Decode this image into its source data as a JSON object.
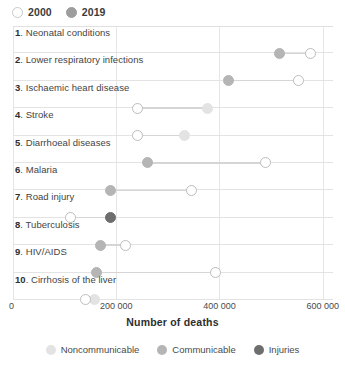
{
  "series_legend": {
    "items": [
      {
        "label": "2000",
        "style": "open",
        "icon": "circle-outline-icon"
      },
      {
        "label": "2019",
        "style": "filled",
        "icon": "circle-filled-icon"
      }
    ]
  },
  "category_legend": {
    "items": [
      {
        "label": "Noncommunicable",
        "color": "#e3e3e3",
        "icon": "circle-filled-icon"
      },
      {
        "label": "Communicable",
        "color": "#b5b5b5",
        "icon": "circle-filled-icon"
      },
      {
        "label": "Injuries",
        "color": "#6e6e6e",
        "icon": "circle-filled-icon"
      }
    ]
  },
  "chart_data": {
    "type": "scatter",
    "subtype": "dumbbell",
    "title": "",
    "xlabel": "Number of deaths",
    "ylabel": "",
    "xlim": [
      0,
      620000
    ],
    "xticks": [
      0,
      200000,
      400000,
      600000
    ],
    "xtick_labels": [
      "0",
      "200 000",
      "400 000",
      "600 000"
    ],
    "grid": "vertical",
    "legend_position": "top-left and bottom-center",
    "series": [
      {
        "name": "2000",
        "marker": "open-circle"
      },
      {
        "name": "2019",
        "marker": "filled-circle"
      }
    ],
    "categories": [
      "Neonatal conditions",
      "Lower respiratory infections",
      "Ischaemic heart disease",
      "Stroke",
      "Diarrhoeal diseases",
      "Malaria",
      "Road injury",
      "Tuberculosis",
      "HIV/AIDS",
      "Cirrhosis of the liver"
    ],
    "points": [
      {
        "rank": "1",
        "label": "Neonatal conditions",
        "group": "Communicable",
        "color": "#b5b5b5",
        "v2000": 577000,
        "v2019": 516000
      },
      {
        "rank": "2",
        "label": "Lower respiratory infections",
        "group": "Communicable",
        "color": "#b5b5b5",
        "v2000": 554000,
        "v2019": 417000
      },
      {
        "rank": "3",
        "label": "Ischaemic heart disease",
        "group": "Noncommunicable",
        "color": "#e3e3e3",
        "v2000": 242000,
        "v2019": 377000
      },
      {
        "rank": "4",
        "label": "Stroke",
        "group": "Noncommunicable",
        "color": "#e3e3e3",
        "v2000": 242000,
        "v2019": 332000
      },
      {
        "rank": "5",
        "label": "Diarrhoeal diseases",
        "group": "Communicable",
        "color": "#b5b5b5",
        "v2000": 490000,
        "v2019": 261000
      },
      {
        "rank": "6",
        "label": "Malaria",
        "group": "Communicable",
        "color": "#b5b5b5",
        "v2000": 345000,
        "v2019": 188000
      },
      {
        "rank": "7",
        "label": "Road injury",
        "group": "Injuries",
        "color": "#6e6e6e",
        "v2000": 111000,
        "v2019": 188000
      },
      {
        "rank": "8",
        "label": "Tuberculosis",
        "group": "Communicable",
        "color": "#b5b5b5",
        "v2000": 218000,
        "v2019": 169000
      },
      {
        "rank": "9",
        "label": "HIV/AIDS",
        "group": "Communicable",
        "color": "#b5b5b5",
        "v2000": 393000,
        "v2019": 161000
      },
      {
        "rank": "10",
        "label": "Cirrhosis of the liver",
        "group": "Noncommunicable",
        "color": "#e3e3e3",
        "v2000": 141000,
        "v2019": 158000
      }
    ]
  }
}
